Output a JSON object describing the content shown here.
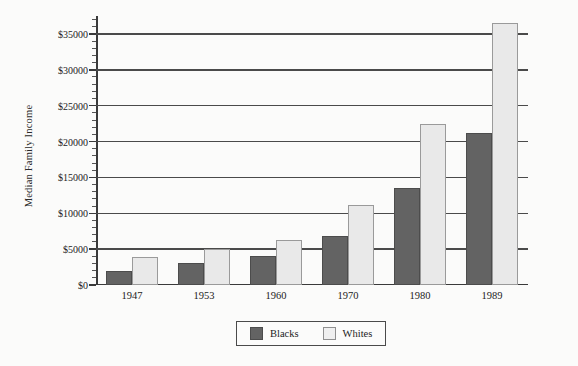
{
  "chart_data": {
    "type": "bar",
    "title": "",
    "xlabel": "",
    "ylabel": "Median Family Income",
    "categories": [
      "1947",
      "1953",
      "1960",
      "1970",
      "1980",
      "1989"
    ],
    "series": [
      {
        "name": "Blacks",
        "color": "#636363",
        "values": [
          2000,
          3100,
          4100,
          6800,
          13500,
          21200
        ]
      },
      {
        "name": "Whites",
        "color": "#e9e9e9",
        "values": [
          3900,
          5000,
          6300,
          11200,
          22500,
          36500
        ]
      }
    ],
    "ylim": [
      0,
      37500
    ],
    "ytick_values": [
      0,
      5000,
      10000,
      15000,
      20000,
      25000,
      30000,
      35000
    ],
    "ytick_labels": [
      "$0",
      "$5000",
      "$10000",
      "$15000",
      "$20000",
      "$25000",
      "$30000",
      "$35000"
    ],
    "yminor_step": 1000,
    "grid": "horizontal",
    "legend_position": "bottom-center",
    "legend_entries": [
      "Blacks",
      "Whites"
    ]
  }
}
